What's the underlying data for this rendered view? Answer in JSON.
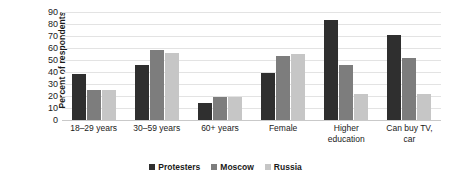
{
  "chart_data": {
    "type": "bar",
    "title": "",
    "xlabel": "",
    "ylabel": "Percent of respondents",
    "ylim": [
      0,
      90
    ],
    "ytick_step": 10,
    "yticks": [
      0,
      10,
      20,
      30,
      40,
      50,
      60,
      70,
      80,
      90
    ],
    "grid": true,
    "legend_position": "bottom",
    "categories": [
      "18–29 years",
      "30–59 years",
      "60+ years",
      "Female",
      "Higher\neducation",
      "Can buy TV,\ncar"
    ],
    "series": [
      {
        "name": "Protesters",
        "color": "#2f2f2f",
        "values": [
          38,
          46,
          14,
          39,
          83,
          71
        ]
      },
      {
        "name": "Moscow",
        "color": "#7d7d7d",
        "values": [
          25,
          58,
          19,
          53,
          46,
          52
        ]
      },
      {
        "name": "Russia",
        "color": "#c6c6c6",
        "values": [
          25,
          56,
          19,
          55,
          22,
          22
        ]
      }
    ]
  }
}
